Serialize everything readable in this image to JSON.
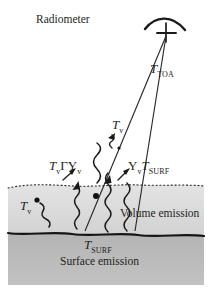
{
  "figure": {
    "title_label": "Radiometer",
    "background_color": "#ffffff",
    "ink_color": "#231f20",
    "volume_layer_color": "#dcdcdc",
    "surface_layer_color": "#b6b6b6"
  },
  "labels": {
    "radiometer": "Radiometer",
    "t_toa_base": "T",
    "t_toa_sub": "TOA",
    "t_v_mid_base": "T",
    "t_v_mid_sub": "v",
    "left_combo_t": "T",
    "left_combo_t_sub": "v",
    "left_combo_gamma": "Γ",
    "left_combo_upsilon": "Υ",
    "left_combo_upsilon_sub": "v",
    "right_combo_upsilon": "Υ",
    "right_combo_upsilon_sub": "v",
    "right_combo_t": "T",
    "right_combo_t_sub": "SURF",
    "t_v_left_base": "T",
    "t_v_left_sub": "v",
    "volume_emission": "Volume emission",
    "t_surf_bottom_base": "T",
    "t_surf_bottom_sub": "SURF",
    "surface_emission": "Surface emission"
  },
  "diagram": {
    "type": "radiative-transfer-schematic",
    "antenna": {
      "feed_x": 166,
      "feed_y": 36
    },
    "layers": [
      {
        "name": "volume",
        "top_y": 186,
        "bottom_y": 234,
        "style": "dotted-top-boundary"
      },
      {
        "name": "surface",
        "top_y": 234,
        "bottom_y": 285,
        "style": "solid-rough-boundary"
      }
    ],
    "rays": [
      {
        "name": "ray-left-beam-edge",
        "from": [
          166,
          36
        ],
        "to": [
          86,
          230
        ]
      },
      {
        "name": "ray-right-beam-edge",
        "from": [
          166,
          36
        ],
        "to": [
          134,
          230
        ]
      }
    ],
    "wavy_arrows": [
      {
        "name": "wavy-volume-left-to-surface"
      },
      {
        "name": "wavy-volume-center"
      },
      {
        "name": "wavy-volume-right"
      },
      {
        "name": "wavy-tv-left-short"
      },
      {
        "name": "wavy-tv-mid-short"
      }
    ],
    "scatter_points": [
      {
        "name": "scatter-dot-left",
        "x": 34,
        "y": 200
      },
      {
        "name": "scatter-dot-upper",
        "x": 94,
        "y": 194
      }
    ]
  }
}
